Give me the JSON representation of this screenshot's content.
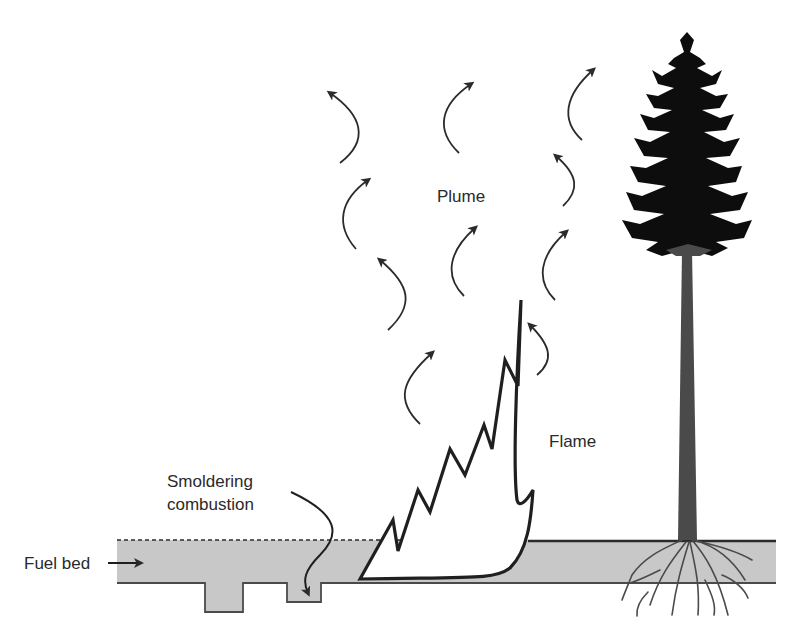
{
  "diagram": {
    "labels": {
      "plume": "Plume",
      "flame": "Flame",
      "smoldering_line1": "Smoldering",
      "smoldering_line2": "combustion",
      "fuel_bed": "Fuel bed"
    },
    "colors": {
      "fuel_bed_fill": "#c8c8c8",
      "outline": "#2b2b2b",
      "tree_crown": "#0d0d0d",
      "tree_trunk": "#4a4a4a",
      "background": "#ffffff"
    },
    "elements": [
      "plume-arrows",
      "flame",
      "tree",
      "roots",
      "fuel-bed",
      "smoldering-pits"
    ]
  }
}
